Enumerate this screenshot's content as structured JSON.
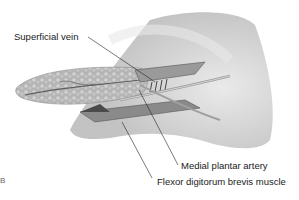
{
  "figure": {
    "type": "anatomical illustration",
    "panel_letter": "B"
  },
  "labels": [
    {
      "id": "superficial-vein",
      "text": "Superficial vein"
    },
    {
      "id": "medial-plantar-artery",
      "text": "Medial plantar artery"
    },
    {
      "id": "flexor-digitorum-brevis",
      "text": "Flexor digitorum brevis muscle"
    }
  ],
  "colors": {
    "background": "#ffffff",
    "skin_shade": "#cfcfcf",
    "fat_tissue": "#a8a8a8",
    "leader_line": "#222222",
    "text": "#1a1a1a"
  }
}
